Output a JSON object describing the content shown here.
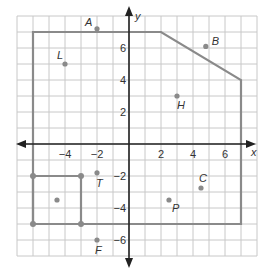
{
  "chart_data": {
    "type": "scatter",
    "title": "",
    "xlabel": "x",
    "ylabel": "y",
    "xlim": [
      -7,
      8
    ],
    "ylim": [
      -7,
      8
    ],
    "grid": true,
    "grid_step": 1,
    "x_tick_labels": [
      "-4",
      "-2",
      "2",
      "4",
      "6"
    ],
    "y_tick_labels": [
      "6",
      "4",
      "2",
      "-2",
      "-4",
      "-6"
    ],
    "points": [
      {
        "label": "A",
        "x": -2,
        "y": 7.2
      },
      {
        "label": "B",
        "x": 4.8,
        "y": 6.1
      },
      {
        "label": "L",
        "x": -4,
        "y": 5
      },
      {
        "label": "H",
        "x": 3,
        "y": 3
      },
      {
        "label": "T",
        "x": -2,
        "y": -1.8
      },
      {
        "label": "C",
        "x": 4.5,
        "y": -2.75
      },
      {
        "label": "P",
        "x": 2.5,
        "y": -3.5
      },
      {
        "label": "F",
        "x": -2,
        "y": -6
      },
      {
        "label": "",
        "x": -4.5,
        "y": -3.5
      }
    ],
    "polygons": [
      {
        "name": "large-region",
        "vertices": [
          [
            -6,
            7
          ],
          [
            2,
            7
          ],
          [
            7,
            4
          ],
          [
            7,
            -5
          ],
          [
            -6,
            -5
          ]
        ]
      },
      {
        "name": "small-square",
        "vertices": [
          [
            -6,
            -2
          ],
          [
            -3,
            -2
          ],
          [
            -3,
            -5
          ],
          [
            -6,
            -5
          ]
        ],
        "vertex_dots": true
      }
    ]
  },
  "axes": {
    "x_label": "x",
    "y_label": "y"
  },
  "colors": {
    "grid": "#c8c8c8",
    "axis": "#222222",
    "polygon": "#8a8a8a",
    "point": "#8a8a8a"
  }
}
